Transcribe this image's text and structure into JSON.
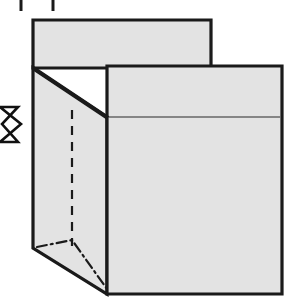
{
  "figure": {
    "title": "Box fold instruction diagram",
    "background_color": "#ffffff",
    "panel_fill_color": "#e3e3e3",
    "outline_color": "#1a1a1a",
    "thin_line_color": "#666666",
    "arrow_fill_color": "#ffffff",
    "arrow_outline_color": "#111111",
    "parts": [
      {
        "name": "top-flap-panel",
        "label": "Top flap panel",
        "shape": "rectangle",
        "points": "33,20 211,20 211,68 33,68",
        "fill": "#e3e3e3",
        "stroke_width": 3.2
      },
      {
        "name": "left-side-panel",
        "label": "Left side panel",
        "shape": "quadrilateral",
        "points": "33,68 107,117 107,294 33,248",
        "fill": "#e3e3e3",
        "stroke_width": 3.2
      },
      {
        "name": "front-panel",
        "label": "Front panel",
        "shape": "rectangle",
        "points": "107,66 282,66 282,294 107,294",
        "fill": "#e3e3e3",
        "stroke_width": 3.2
      },
      {
        "name": "front-panel-crease",
        "label": "Front panel horizontal crease line",
        "shape": "line",
        "points": "107,117 282,117",
        "stroke": "#666666",
        "stroke_width": 1.4
      },
      {
        "name": "side-panel-fold-dashed-line",
        "label": "Vertical dashed fold line on side panel",
        "shape": "dashed-line",
        "points": "72,110 72,246",
        "dash": "9 7",
        "stroke_width": 2.2
      },
      {
        "name": "bottom-chain-fold-line",
        "label": "Dash-dot bottom gusset fold line",
        "shape": "chain-line",
        "points": "37,247 72,240 107,289",
        "dash": "10 4 2 4",
        "stroke_width": 2.2
      },
      {
        "name": "direction-arrow",
        "label": "Push direction arrow",
        "shape": "block-arrow",
        "direction": "right",
        "points": "0,107 18,107 2,124 18,142 0,142 21,124",
        "fill": "#ffffff",
        "stroke_width": 2.6
      },
      {
        "name": "crop-tick-left",
        "label": "Left crop tick mark",
        "shape": "vertical-tick",
        "points": "21,0 21,11",
        "stroke_width": 3
      },
      {
        "name": "crop-tick-right",
        "label": "Right crop tick mark",
        "shape": "vertical-tick",
        "points": "53,0 53,11",
        "stroke_width": 3
      }
    ]
  }
}
